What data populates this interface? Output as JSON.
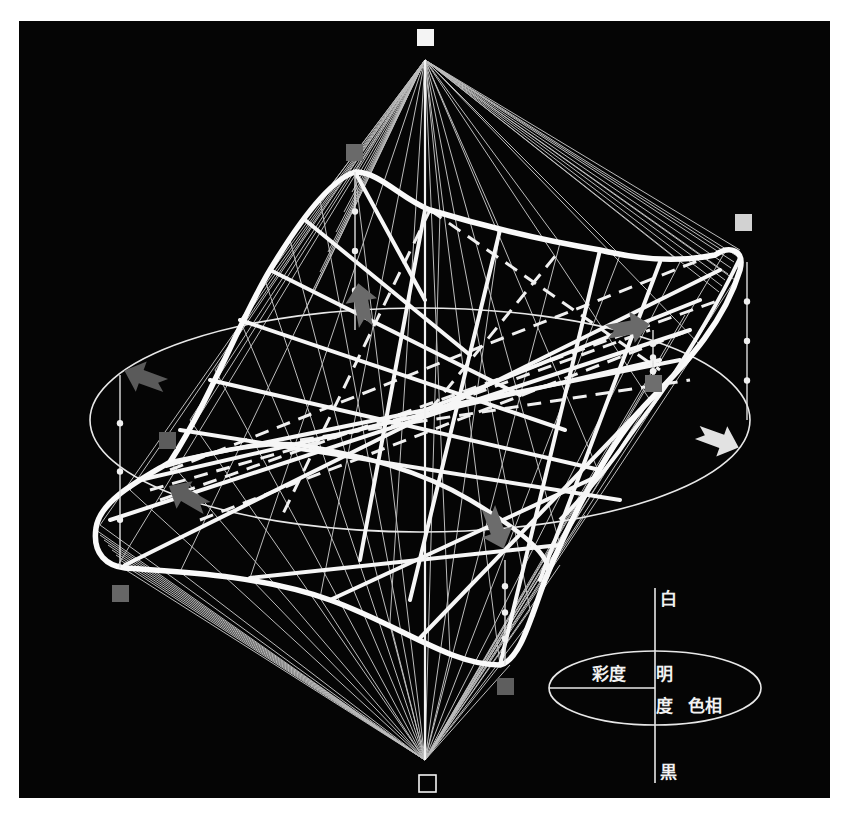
{
  "figure": {
    "background_color": "#050505",
    "line_color": "#f4f4f4"
  },
  "legend": {
    "white": "白",
    "black": "黒",
    "saturation": "彩度",
    "lightness_1": "明",
    "lightness_2": "度",
    "hue": "色相"
  },
  "markers": {
    "top_point": {
      "label": "white point",
      "fill": "#f4f4f4"
    },
    "bottom_point": {
      "label": "black point",
      "fill": "#050505",
      "stroke": "#f4f4f4"
    },
    "hue_squares": [
      {
        "name": "hue-square-upper-left",
        "fill": "#6a6a6a"
      },
      {
        "name": "hue-square-upper-right",
        "fill": "#d2d2d2"
      },
      {
        "name": "hue-square-right",
        "fill": "#6e6e6e"
      },
      {
        "name": "hue-square-left",
        "fill": "#5c5c5c"
      },
      {
        "name": "hue-square-lower-left",
        "fill": "#666666"
      },
      {
        "name": "hue-square-lower-right",
        "fill": "#5e5e5e"
      }
    ]
  },
  "arrows": [
    {
      "name": "arrow-left",
      "fill": "#5a5a5a"
    },
    {
      "name": "arrow-upper",
      "fill": "#6a6a6a"
    },
    {
      "name": "arrow-upper-right",
      "fill": "#6a6a6a"
    },
    {
      "name": "arrow-right",
      "fill": "#e2e2e2"
    },
    {
      "name": "arrow-lower",
      "fill": "#6c6c6c"
    },
    {
      "name": "arrow-lower-left",
      "fill": "#5e5e5e"
    }
  ]
}
